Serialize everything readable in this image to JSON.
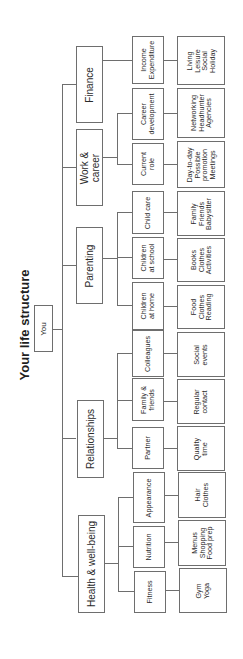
{
  "title": "Your life structure",
  "root": "You",
  "categories": [
    {
      "label": "Finance",
      "items": [
        {
          "label": "Income\nExpenditure",
          "details": "Living\nLeisure\nSocial\nHoliday"
        }
      ]
    },
    {
      "label": "Work &\ncareer",
      "items": [
        {
          "label": "Career\ndevelopment",
          "details": "Networking\nHeadhunter\nAgencies"
        },
        {
          "label": "Current\nrole",
          "details": "Day-to-day\nPossible\npromotion\nMeetings"
        }
      ]
    },
    {
      "label": "Parenting",
      "items": [
        {
          "label": "Child care",
          "details": "Family\nFriends\nBabysitter"
        },
        {
          "label": "Children\nat school",
          "details": "Books\nClothes\nActivities"
        },
        {
          "label": "Children\nat home",
          "details": "Food\nClothes\nReading"
        }
      ]
    },
    {
      "label": "Relationships",
      "items": [
        {
          "label": "Colleagues",
          "details": "Social\nevents"
        },
        {
          "label": "Family &\nfriends",
          "details": "Regular\ncontact"
        },
        {
          "label": "Partner",
          "details": "Quality\ntime"
        }
      ]
    },
    {
      "label": "Health & well-being",
      "items": [
        {
          "label": "Appearance",
          "details": "Hair\nClothes"
        },
        {
          "label": "Nutrition",
          "details": "Menus\nShopping\nFood prep"
        },
        {
          "label": "Fitness",
          "details": "Gym\nYoga"
        }
      ]
    }
  ]
}
